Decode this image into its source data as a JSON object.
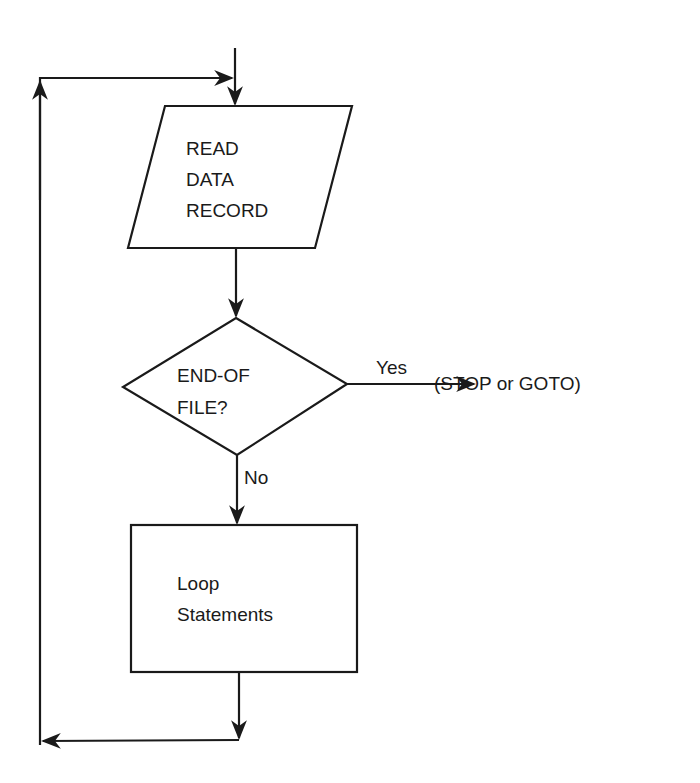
{
  "flowchart": {
    "io_node": {
      "lines": [
        "READ",
        "DATA",
        "RECORD"
      ]
    },
    "decision_node": {
      "lines": [
        "END-OF",
        "FILE?"
      ]
    },
    "yes_label": "Yes",
    "no_label": "No",
    "yes_target": "(STOP or GOTO)",
    "process_node": {
      "lines": [
        "Loop",
        "Statements"
      ]
    }
  },
  "colors": {
    "stroke": "#1a1a1a",
    "background": "#ffffff"
  }
}
